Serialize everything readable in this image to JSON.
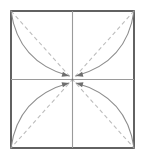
{
  "diagram": {
    "type": "origami-fold-instruction",
    "canvas": {
      "width": 145,
      "height": 160,
      "background": "#ffffff"
    },
    "colors": {
      "paper_border": "#3b3b3b",
      "paper_fill": "#ffffff",
      "midline": "#9a9a9a",
      "crease_dashed": "#bdbdbd",
      "fold_arc": "#8d8d8d",
      "arrowhead": "#6e6e6e"
    },
    "square": {
      "label": "paper-square",
      "left": 11,
      "top": 11,
      "right": 134,
      "bottom": 148,
      "stroke_width": 1.6
    },
    "center_point": {
      "label": "center-target",
      "x": 72.5,
      "y": 79.5
    },
    "midlines": [
      {
        "label": "vertical-midline",
        "x1": 72.5,
        "y1": 11,
        "x2": 72.5,
        "y2": 148,
        "stroke_width": 1.1
      },
      {
        "label": "horizontal-midline",
        "x1": 11,
        "y1": 79.5,
        "x2": 134,
        "y2": 79.5,
        "stroke_width": 1.1
      }
    ],
    "creases": [
      {
        "label": "diagonal-crease-tl-br",
        "x1": 11,
        "y1": 11,
        "x2": 134,
        "y2": 148,
        "dash": "4 3",
        "stroke_width": 1.1
      },
      {
        "label": "diagonal-crease-tr-bl",
        "x1": 134,
        "y1": 11,
        "x2": 11,
        "y2": 148,
        "dash": "4 3",
        "stroke_width": 1.1
      }
    ],
    "fold_arcs": [
      {
        "label": "fold-arc-top-left",
        "from_corner": "top-left",
        "start": {
          "x": 11,
          "y": 11
        },
        "end": {
          "x": 69,
          "y": 76
        },
        "control": {
          "x": 18,
          "y": 62
        },
        "arrow_angle_deg": 42,
        "stroke_width": 1.1
      },
      {
        "label": "fold-arc-top-right",
        "from_corner": "top-right",
        "start": {
          "x": 134,
          "y": 11
        },
        "end": {
          "x": 76,
          "y": 76
        },
        "control": {
          "x": 127,
          "y": 62
        },
        "arrow_angle_deg": 138,
        "stroke_width": 1.1
      },
      {
        "label": "fold-arc-bottom-left",
        "from_corner": "bottom-left",
        "start": {
          "x": 11,
          "y": 148
        },
        "end": {
          "x": 69,
          "y": 83
        },
        "control": {
          "x": 18,
          "y": 97
        },
        "arrow_angle_deg": -42,
        "stroke_width": 1.1
      },
      {
        "label": "fold-arc-bottom-right",
        "from_corner": "bottom-right",
        "start": {
          "x": 134,
          "y": 148
        },
        "end": {
          "x": 76,
          "y": 83
        },
        "control": {
          "x": 127,
          "y": 97
        },
        "arrow_angle_deg": -138,
        "stroke_width": 1.1
      }
    ],
    "arrowheads": [
      {
        "label": "arrowhead-top-left",
        "x": 69,
        "y": 76,
        "angle_deg": 42,
        "size": 7
      },
      {
        "label": "arrowhead-top-right",
        "x": 76,
        "y": 76,
        "angle_deg": 138,
        "size": 7
      },
      {
        "label": "arrowhead-bottom-left",
        "x": 69,
        "y": 83,
        "angle_deg": -42,
        "size": 7
      },
      {
        "label": "arrowhead-bottom-right",
        "x": 76,
        "y": 83,
        "angle_deg": -138,
        "size": 7
      }
    ]
  }
}
